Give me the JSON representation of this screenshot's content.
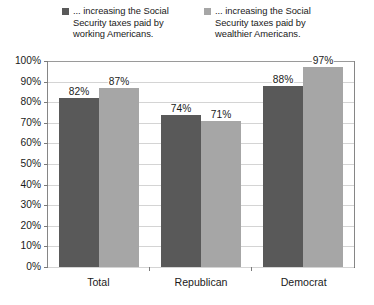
{
  "chart_data": {
    "type": "bar",
    "title": "",
    "subtitle": "",
    "xlabel": "",
    "ylabel": "",
    "categories": [
      "Total",
      "Republican",
      "Democrat"
    ],
    "series": [
      {
        "name": "... increasing the Social Security taxes paid by working Americans.",
        "color": "#595959",
        "values": [
          82,
          74,
          88
        ],
        "value_labels": [
          "82%",
          "74%",
          "88%"
        ]
      },
      {
        "name": "... increasing the Social Security taxes paid by wealthier Americans.",
        "color": "#a6a6a6",
        "values": [
          87,
          71,
          97
        ],
        "value_labels": [
          "87%",
          "71%",
          "97%"
        ]
      }
    ],
    "ylim": [
      0,
      100
    ],
    "ytick_step": 10,
    "ytick_labels": [
      "100%",
      "90%",
      "80%",
      "70%",
      "60%",
      "50%",
      "40%",
      "30%",
      "20%",
      "10%",
      "0%"
    ],
    "ytick_values": [
      100,
      90,
      80,
      70,
      60,
      50,
      40,
      30,
      20,
      10,
      0
    ],
    "value_suffix": "%",
    "grid": true,
    "grid_orientation": "horizontal",
    "legend_position": "top",
    "data_labels": true
  },
  "legend": {
    "entries": [
      {
        "label": "... increasing the Social Security taxes paid by working Americans.",
        "color": "#595959",
        "swatch_name": "legend-swatch-working-americans"
      },
      {
        "label": "... increasing the Social Security taxes paid by wealthier Americans.",
        "color": "#a6a6a6",
        "swatch_name": "legend-swatch-wealthier-americans"
      }
    ]
  },
  "axes": {
    "y": {
      "ticks": [
        "100%",
        "90%",
        "80%",
        "70%",
        "60%",
        "50%",
        "40%",
        "30%",
        "20%",
        "10%",
        "0%"
      ],
      "min": 0,
      "max": 100
    },
    "x": {
      "ticks": [
        "Total",
        "Republican",
        "Democrat"
      ]
    }
  },
  "colors": {
    "series_1": "#595959",
    "series_2": "#a6a6a6",
    "gridline": "#d4d4d4",
    "axis": "#5a5a5a",
    "plot_border": "#868686",
    "text": "#1a1a1a",
    "background": "#ffffff"
  }
}
